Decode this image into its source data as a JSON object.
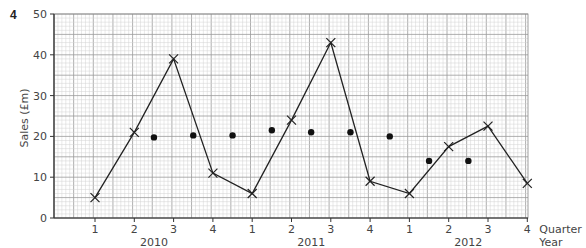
{
  "question_number": "4",
  "chart_data": {
    "type": "line",
    "title": "",
    "xlabel": "Quarter / Year",
    "ylabel": "Sales (£m)",
    "ylim": [
      0,
      50
    ],
    "yticks": [
      0,
      10,
      20,
      30,
      40,
      50
    ],
    "grid": true,
    "x_quarters": [
      "1",
      "2",
      "3",
      "4",
      "1",
      "2",
      "3",
      "4",
      "1",
      "2",
      "3",
      "4"
    ],
    "x_years": [
      "2010",
      "2011",
      "2012"
    ],
    "x_axis_label_quarter": "Quarter",
    "x_axis_label_year": "Year",
    "series": [
      {
        "name": "Sales",
        "marker": "x",
        "connected": true,
        "x": [
          1,
          2,
          3,
          4,
          5,
          6,
          7,
          8,
          9,
          10,
          11,
          12
        ],
        "values": [
          5,
          21,
          39,
          11,
          6,
          24,
          43,
          9,
          6,
          17.5,
          22.5,
          8.5
        ]
      },
      {
        "name": "Moving average",
        "marker": "dot",
        "connected": false,
        "x": [
          2.5,
          3.5,
          4.5,
          5.5,
          6.5,
          7.5,
          8.5,
          9.5,
          10.5
        ],
        "values": [
          19.75,
          20.25,
          20.25,
          21.5,
          21,
          21,
          20,
          14,
          14
        ]
      }
    ]
  }
}
